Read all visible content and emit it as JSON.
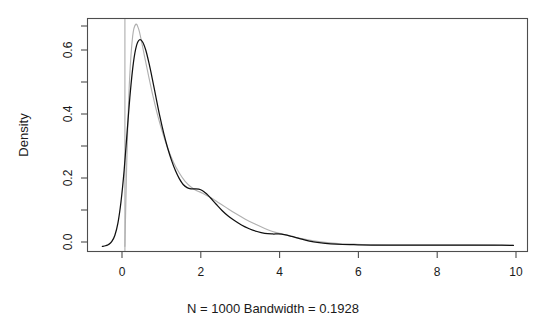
{
  "chart_data": {
    "type": "line",
    "title": "",
    "subtitle": "",
    "xlabel": "",
    "ylabel": "Density",
    "caption": "N = 1000   Bandwidth = 0.1928",
    "caption_parts": {
      "n_label": "N = 1000",
      "bandwidth_label": "Bandwidth = 0.1928"
    },
    "xlim": [
      -0.95,
      10.35
    ],
    "ylim": [
      -0.015,
      0.735
    ],
    "xticks": [
      0,
      2,
      4,
      6,
      8,
      10
    ],
    "xtick_labels": [
      "0",
      "2",
      "4",
      "6",
      "8",
      "10"
    ],
    "yticks": [
      0.0,
      0.2,
      0.4,
      0.6
    ],
    "ytick_labels": [
      "0.0",
      "0.2",
      "0.4",
      "0.6"
    ],
    "yticks_minor": [
      0.1,
      0.3,
      0.5,
      0.7
    ],
    "grid": false,
    "legend": "none",
    "box": true,
    "colors": {
      "estimate": "#111111",
      "reference": "#b0b0b0",
      "axis": "#4d4d4d",
      "background": "#ffffff"
    },
    "series": [
      {
        "name": "Kernel density estimate",
        "color": "#111111",
        "x": [
          -0.58,
          -0.5,
          -0.42,
          -0.34,
          -0.26,
          -0.18,
          -0.1,
          -0.02,
          0.06,
          0.14,
          0.22,
          0.3,
          0.38,
          0.46,
          0.54,
          0.62,
          0.7,
          0.8,
          0.9,
          1.0,
          1.1,
          1.2,
          1.3,
          1.4,
          1.5,
          1.6,
          1.7,
          1.8,
          1.9,
          2.0,
          2.1,
          2.2,
          2.35,
          2.5,
          2.65,
          2.8,
          3.0,
          3.2,
          3.4,
          3.6,
          3.8,
          3.95,
          4.1,
          4.3,
          4.5,
          4.75,
          5.0,
          5.3,
          5.6,
          6.0,
          6.5,
          7.0,
          7.5,
          8.0,
          8.5,
          9.0,
          9.4,
          9.7,
          10.0
        ],
        "y": [
          0.0,
          0.002,
          0.006,
          0.015,
          0.035,
          0.075,
          0.145,
          0.245,
          0.375,
          0.5,
          0.595,
          0.65,
          0.668,
          0.66,
          0.633,
          0.592,
          0.545,
          0.482,
          0.42,
          0.365,
          0.318,
          0.278,
          0.245,
          0.219,
          0.2,
          0.19,
          0.186,
          0.186,
          0.185,
          0.18,
          0.17,
          0.157,
          0.136,
          0.116,
          0.099,
          0.085,
          0.069,
          0.057,
          0.048,
          0.042,
          0.04,
          0.04,
          0.038,
          0.032,
          0.025,
          0.017,
          0.012,
          0.008,
          0.006,
          0.005,
          0.004,
          0.004,
          0.004,
          0.004,
          0.004,
          0.004,
          0.004,
          0.004,
          0.003
        ]
      },
      {
        "name": "Reference density",
        "color": "#b0b0b0",
        "x": [
          0.0,
          0.02,
          0.06,
          0.12,
          0.2,
          0.28,
          0.36,
          0.44,
          0.52,
          0.62,
          0.72,
          0.84,
          0.96,
          1.1,
          1.25,
          1.4,
          1.55,
          1.7,
          1.85,
          2.0,
          2.2,
          2.4,
          2.6,
          2.85,
          3.1,
          3.35,
          3.6,
          3.85,
          4.05,
          4.3,
          4.55,
          4.85,
          5.15,
          5.5,
          5.9,
          6.4,
          7.0,
          7.6,
          8.2,
          8.9,
          9.5,
          10.0
        ],
        "y": [
          0.0,
          0.12,
          0.33,
          0.54,
          0.68,
          0.718,
          0.7,
          0.655,
          0.605,
          0.545,
          0.487,
          0.425,
          0.372,
          0.318,
          0.272,
          0.237,
          0.21,
          0.192,
          0.18,
          0.172,
          0.158,
          0.142,
          0.126,
          0.106,
          0.088,
          0.072,
          0.058,
          0.046,
          0.04,
          0.032,
          0.025,
          0.018,
          0.013,
          0.009,
          0.007,
          0.005,
          0.004,
          0.004,
          0.004,
          0.004,
          0.003,
          0.003
        ]
      }
    ],
    "annotations": [
      {
        "name": "support-boundary",
        "type": "vline",
        "x": 0,
        "color": "#b0b0b0"
      }
    ]
  }
}
